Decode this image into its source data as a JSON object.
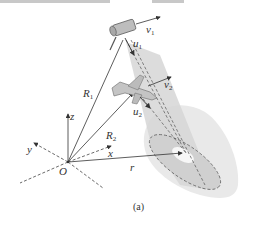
{
  "figure": {
    "caption": "(a)",
    "labels": {
      "v1": {
        "base": "v",
        "sub": "1"
      },
      "u1": {
        "base": "u",
        "sub": "1"
      },
      "v2": {
        "base": "v",
        "sub": "2"
      },
      "u2": {
        "base": "u",
        "sub": "2"
      },
      "R1": {
        "base": "R",
        "sub": "1"
      },
      "R2": {
        "base": "R",
        "sub": "2"
      },
      "z": "z",
      "y": "y",
      "x": "x",
      "r": "r",
      "O": "O"
    },
    "objects": [
      "satellite",
      "aircraft",
      "radar-beam-cone",
      "ground-footprint-ellipse",
      "coordinate-axes"
    ],
    "colors": {
      "line": "#444444",
      "beam": "#d9d9d9",
      "footprint": "#e6e6e6",
      "dashed": "#555555"
    }
  }
}
